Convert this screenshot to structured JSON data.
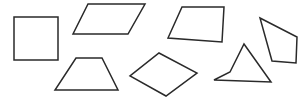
{
  "figure": {
    "canvas": {
      "width": 306,
      "height": 108,
      "background_color": "#ffffff"
    },
    "style": {
      "stroke_color": "#2a2a2a",
      "stroke_width": 1.5,
      "fill": "none"
    },
    "shapes": [
      {
        "id": "shape-1",
        "name": "square",
        "label": "Square",
        "row": "top",
        "position": "far-left",
        "convex": true,
        "points": "14,17 58,17 58,60 14,60"
      },
      {
        "id": "shape-2",
        "name": "parallelogram",
        "label": "Parallelogram",
        "row": "top",
        "position": "left-center",
        "convex": true,
        "points": "88,4 145,4 128,34 73,34"
      },
      {
        "id": "shape-3",
        "name": "trapezoid-right",
        "label": "Right-leaning trapezoid",
        "row": "top",
        "position": "right-center",
        "convex": true,
        "points": "182,7 224,7 222,42 168,38"
      },
      {
        "id": "shape-4",
        "name": "irregular-quadrilateral",
        "label": "Irregular quadrilateral",
        "row": "top",
        "position": "far-right",
        "convex": true,
        "points": "260,18 297,37 296,63 272,61"
      },
      {
        "id": "shape-5",
        "name": "isosceles-trapezoid",
        "label": "Isosceles trapezoid",
        "row": "bottom",
        "position": "left",
        "convex": true,
        "points": "76,58 102,58 118,90 55,90"
      },
      {
        "id": "shape-6",
        "name": "rhombus",
        "label": "Rhombus",
        "row": "bottom",
        "position": "center",
        "convex": true,
        "points": "159,53 197,73 166,96 130,76"
      },
      {
        "id": "shape-7",
        "name": "concave-dart",
        "label": "Concave dart quadrilateral",
        "row": "bottom",
        "position": "right",
        "convex": false,
        "points": "244,44 271,82 214,80 230,72"
      }
    ]
  }
}
